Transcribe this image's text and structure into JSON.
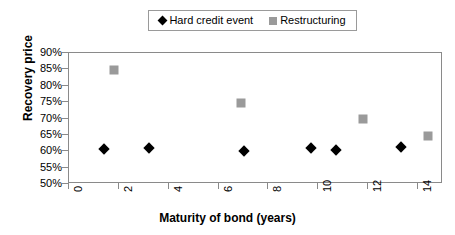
{
  "chart_data": {
    "type": "scatter",
    "title": "",
    "xlabel": "Maturity of bond (years)",
    "ylabel": "Recovery price",
    "xlim": [
      0,
      15
    ],
    "ylim": [
      50,
      90
    ],
    "grid": false,
    "legend_position": "top-center",
    "xticks": [
      "0",
      "2",
      "4",
      "6",
      "8",
      "10",
      "12",
      "14"
    ],
    "xtick_values": [
      0,
      2,
      4,
      6,
      8,
      10,
      12,
      14
    ],
    "yticks": [
      "50%",
      "55%",
      "60%",
      "65%",
      "70%",
      "75%",
      "80%",
      "85%",
      "90%"
    ],
    "ytick_values": [
      50,
      55,
      60,
      65,
      70,
      75,
      80,
      85,
      90
    ],
    "series": [
      {
        "name": "Hard credit event",
        "marker": "diamond",
        "color": "#000000",
        "points": [
          {
            "x": 1.4,
            "y": 60.8
          },
          {
            "x": 3.2,
            "y": 61.1
          },
          {
            "x": 7.0,
            "y": 60.2
          },
          {
            "x": 9.7,
            "y": 61.0
          },
          {
            "x": 10.7,
            "y": 60.3
          },
          {
            "x": 13.3,
            "y": 61.4
          }
        ]
      },
      {
        "name": "Restructuring",
        "marker": "square",
        "color": "#9a9a9a",
        "points": [
          {
            "x": 1.8,
            "y": 84.8
          },
          {
            "x": 6.9,
            "y": 74.7
          },
          {
            "x": 11.8,
            "y": 69.7
          },
          {
            "x": 14.4,
            "y": 64.6
          }
        ]
      }
    ]
  }
}
